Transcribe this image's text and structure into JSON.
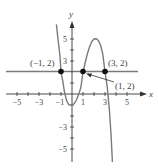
{
  "diagram": {
    "axes": {
      "x_label": "x",
      "y_label": "y"
    },
    "x_ticks": [
      {
        "value": -5,
        "label": "−5"
      },
      {
        "value": -3,
        "label": "−3"
      },
      {
        "value": -1,
        "label": "−1"
      },
      {
        "value": 1,
        "label": "1"
      },
      {
        "value": 3,
        "label": "3"
      },
      {
        "value": 5,
        "label": "5"
      }
    ],
    "y_ticks": [
      {
        "value": 5,
        "label": "5"
      },
      {
        "value": 3,
        "label": "3"
      },
      {
        "value": -3,
        "label": "−3"
      },
      {
        "value": -5,
        "label": "−5"
      }
    ],
    "points": [
      {
        "x": -1,
        "y": 2,
        "label": "(−1, 2)"
      },
      {
        "x": 1,
        "y": 2,
        "label": "(1, 2)"
      },
      {
        "x": 3,
        "y": 2,
        "label": "(3, 2)"
      }
    ],
    "curve": "cubic y = -x^3 + 3x^2 + x - 1",
    "line": "y = 2",
    "colors": {
      "curve": "#777777",
      "line": "#777777",
      "axis": "#333333",
      "point": "#111111"
    }
  }
}
